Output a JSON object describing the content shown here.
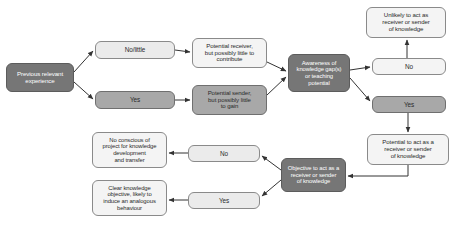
{
  "diagram": {
    "colors": {
      "dark_fill": "#767676",
      "mid_fill": "#a8a8a8",
      "light_fill": "#ebebeb",
      "pale_fill": "#f4f4f4",
      "stroke": "#7a7a7a",
      "connector": "#333333",
      "background": "#ffffff"
    },
    "nodes": [
      {
        "id": "previous-relevant-experience",
        "label": "Previous relevant\nexperience",
        "style": "dark",
        "x": 6,
        "y": 63,
        "w": 68,
        "h": 29
      },
      {
        "id": "no-little",
        "label": "No/little",
        "style": "light",
        "x": 95,
        "y": 41,
        "w": 80,
        "h": 18
      },
      {
        "id": "yes-experience",
        "label": "Yes",
        "style": "mid",
        "x": 95,
        "y": 91,
        "w": 80,
        "h": 18
      },
      {
        "id": "potential-receiver",
        "label": "Potential receiver,\nbut possibly little to\ncontribute",
        "style": "pale",
        "x": 192,
        "y": 38,
        "w": 75,
        "h": 30
      },
      {
        "id": "potential-sender",
        "label": "Potential sender,\nbut possibly little\nto gain",
        "style": "mid",
        "x": 192,
        "y": 85,
        "w": 75,
        "h": 30
      },
      {
        "id": "awareness-of-knowledge-gaps",
        "label": "Awareness of\nknowledge gap(s)\nor teaching\npotential",
        "style": "dark",
        "x": 288,
        "y": 54,
        "w": 62,
        "h": 38
      },
      {
        "id": "unlikely-to-act",
        "label": "Unlikely to act as\nreceiver or sender\nof knowledge",
        "style": "pale",
        "x": 366,
        "y": 7,
        "w": 80,
        "h": 31
      },
      {
        "id": "no-awareness",
        "label": "No",
        "style": "pale",
        "x": 372,
        "y": 58,
        "w": 74,
        "h": 17
      },
      {
        "id": "yes-awareness",
        "label": "Yes",
        "style": "mid",
        "x": 372,
        "y": 96,
        "w": 74,
        "h": 17
      },
      {
        "id": "potential-to-act",
        "label": "Potential to act as a\nreceiver or sender\nof knowledge",
        "style": "pale",
        "x": 367,
        "y": 134,
        "w": 82,
        "h": 31
      },
      {
        "id": "objective-to-act",
        "label": "Objective to act as a\nreceiver or sender\nof knowledge",
        "style": "dark",
        "x": 281,
        "y": 158,
        "w": 65,
        "h": 34
      },
      {
        "id": "no-objective",
        "label": "No",
        "style": "light",
        "x": 188,
        "y": 145,
        "w": 72,
        "h": 17
      },
      {
        "id": "yes-objective",
        "label": "Yes",
        "style": "light",
        "x": 188,
        "y": 192,
        "w": 72,
        "h": 17
      },
      {
        "id": "no-conscious-project",
        "label": "No conscious of\nproject for knowledge\ndevelopment\nand transfer",
        "style": "pale",
        "x": 92,
        "y": 132,
        "w": 75,
        "h": 36
      },
      {
        "id": "clear-knowledge-objective",
        "label": "Clear knowledge\nobjective, likely to\ninduce an analogous\nbehaviour",
        "style": "pale",
        "x": 92,
        "y": 180,
        "w": 75,
        "h": 36
      }
    ],
    "connectors": [
      {
        "id": "experience-to-nolittle",
        "from": "previous-relevant-experience",
        "to": "no-little"
      },
      {
        "id": "experience-to-yes",
        "from": "previous-relevant-experience",
        "to": "yes-experience"
      },
      {
        "id": "nolittle-to-receiver",
        "from": "no-little",
        "to": "potential-receiver"
      },
      {
        "id": "yes-to-sender",
        "from": "yes-experience",
        "to": "potential-sender"
      },
      {
        "id": "receiver-to-awareness",
        "from": "potential-receiver",
        "to": "awareness-of-knowledge-gaps"
      },
      {
        "id": "sender-to-awareness",
        "from": "potential-sender",
        "to": "awareness-of-knowledge-gaps"
      },
      {
        "id": "awareness-to-no",
        "from": "awareness-of-knowledge-gaps",
        "to": "no-awareness"
      },
      {
        "id": "awareness-to-yes",
        "from": "awareness-of-knowledge-gaps",
        "to": "yes-awareness"
      },
      {
        "id": "no-to-unlikely",
        "from": "no-awareness",
        "to": "unlikely-to-act"
      },
      {
        "id": "yes-to-potential",
        "from": "yes-awareness",
        "to": "potential-to-act"
      },
      {
        "id": "potential-to-objective",
        "from": "potential-to-act",
        "to": "objective-to-act"
      },
      {
        "id": "objective-to-no",
        "from": "objective-to-act",
        "to": "no-objective"
      },
      {
        "id": "objective-to-yes",
        "from": "objective-to-act",
        "to": "yes-objective"
      },
      {
        "id": "no-to-noconscious",
        "from": "no-objective",
        "to": "no-conscious-project"
      },
      {
        "id": "yes-to-clear",
        "from": "yes-objective",
        "to": "clear-knowledge-objective"
      }
    ]
  }
}
